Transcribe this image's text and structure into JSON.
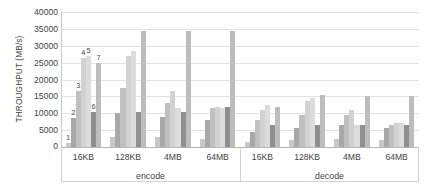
{
  "chart_data": {
    "type": "bar",
    "title": "",
    "xlabel": "",
    "ylabel": "THROUGHPUT (MB/s)",
    "ylim": [
      0,
      40000
    ],
    "ytick_labels": [
      "40000",
      "35000",
      "30000",
      "25000",
      "20000",
      "15000",
      "10000",
      "5000",
      "0"
    ],
    "ytick_values": [
      40000,
      35000,
      30000,
      25000,
      20000,
      15000,
      10000,
      5000,
      0
    ],
    "grid": true,
    "legend": "none",
    "categories": [
      "16KB",
      "128KB",
      "4MB",
      "64MB",
      "16KB",
      "128KB",
      "4MB",
      "64MB"
    ],
    "supercategories": [
      "encode",
      "decode"
    ],
    "series": [
      {
        "name": "1",
        "values": [
          1200,
          2900,
          2900,
          2500,
          1500,
          2000,
          2500,
          2000
        ]
      },
      {
        "name": "2",
        "values": [
          8500,
          10000,
          9000,
          8000,
          4500,
          5500,
          6500,
          5500
        ]
      },
      {
        "name": "3",
        "values": [
          16500,
          17500,
          13000,
          11500,
          8000,
          9500,
          9500,
          6500
        ]
      },
      {
        "name": "4",
        "values": [
          26500,
          27000,
          16500,
          12000,
          11000,
          13500,
          11000,
          7000
        ]
      },
      {
        "name": "5",
        "values": [
          27000,
          28500,
          11500,
          11500,
          12500,
          14500,
          6500,
          7000
        ]
      },
      {
        "name": "6",
        "values": [
          10500,
          10500,
          10500,
          11800,
          6500,
          6500,
          6500,
          6500
        ]
      },
      {
        "name": "7",
        "values": [
          25000,
          34500,
          34500,
          34500,
          12000,
          15500,
          15000,
          15000
        ]
      }
    ],
    "bar_colors": [
      "#c8c8c8",
      "#a8a8a8",
      "#c0c0c0",
      "#d2d2d2",
      "#dcdcdc",
      "#8f8f8f",
      "#bdbdbd"
    ],
    "point_labels": {
      "group_index": 0,
      "labels": [
        "1",
        "2",
        "3",
        "4",
        "5",
        "6",
        "7"
      ]
    }
  }
}
